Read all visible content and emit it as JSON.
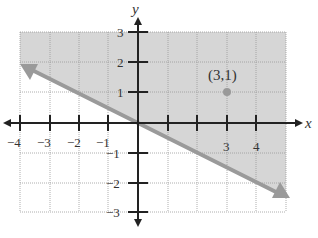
{
  "graph": {
    "type": "linear inequality",
    "axes": {
      "x_label": "x",
      "y_label": "y",
      "x_ticks": [
        {
          "value": -4,
          "label": "−4"
        },
        {
          "value": -3,
          "label": "−3"
        },
        {
          "value": -2,
          "label": "−2"
        },
        {
          "value": -1,
          "label": "−1"
        },
        {
          "value": 3,
          "label": "3"
        },
        {
          "value": 4,
          "label": "4"
        }
      ],
      "y_ticks": [
        {
          "value": 3,
          "label": "3"
        },
        {
          "value": 2,
          "label": "2"
        },
        {
          "value": 1,
          "label": "1"
        },
        {
          "value": -1,
          "label": "−1"
        },
        {
          "value": -2,
          "label": "−2"
        },
        {
          "value": -3,
          "label": "−3"
        }
      ],
      "x_range": [
        -4,
        4.9
      ],
      "y_range": [
        -3,
        3
      ]
    },
    "boundary_line": {
      "style": "solid",
      "from": [
        -4,
        2
      ],
      "to": [
        4.9,
        -2.4
      ],
      "slope": -0.5,
      "intercept": 0,
      "color": "#999999"
    },
    "shaded_region": "above the line",
    "shade_color": "#d9d9d9",
    "test_point": {
      "x": 3,
      "y": 1,
      "label": "(3,1)",
      "color": "#999999"
    }
  }
}
